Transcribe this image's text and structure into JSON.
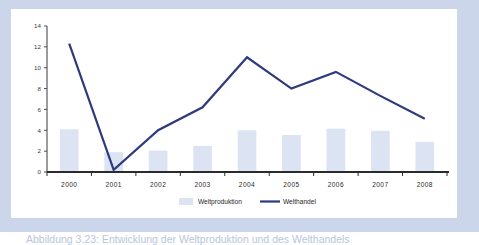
{
  "figure": {
    "caption": "Abbildung 3.23: Entwicklung der Weltproduktion und des Welthandels",
    "frame_color": "#ccd6ea",
    "panel_color": "#ffffff"
  },
  "chart_data": {
    "type": "bar",
    "title": "",
    "xlabel": "",
    "ylabel": "",
    "categories": [
      "2000",
      "2001",
      "2002",
      "2003",
      "2004",
      "2005",
      "2006",
      "2007",
      "2008"
    ],
    "ylim": [
      0,
      14
    ],
    "yticks": [
      0,
      2,
      4,
      6,
      8,
      10,
      12,
      14
    ],
    "ytick_labels": [
      "0",
      "2",
      "4",
      "6",
      "8",
      "10",
      "12",
      "14"
    ],
    "grid": false,
    "legend_position": "bottom",
    "series": [
      {
        "name": "Weltproduktion",
        "kind": "bar",
        "color": "#dce3f2",
        "values": [
          4.1,
          1.9,
          2.05,
          2.5,
          4.0,
          3.55,
          4.15,
          3.95,
          2.9
        ]
      },
      {
        "name": "Welthandel",
        "kind": "line",
        "color": "#2e3a7c",
        "values": [
          12.3,
          0.2,
          4.0,
          6.2,
          11.0,
          8.0,
          9.6,
          7.3,
          5.1
        ]
      }
    ]
  },
  "legend": {
    "items": [
      {
        "label": "Weltproduktion",
        "marker": "bar-swatch",
        "color": "#dce3f2"
      },
      {
        "label": "Welthandel",
        "marker": "line-swatch",
        "color": "#2e3a7c"
      }
    ]
  }
}
